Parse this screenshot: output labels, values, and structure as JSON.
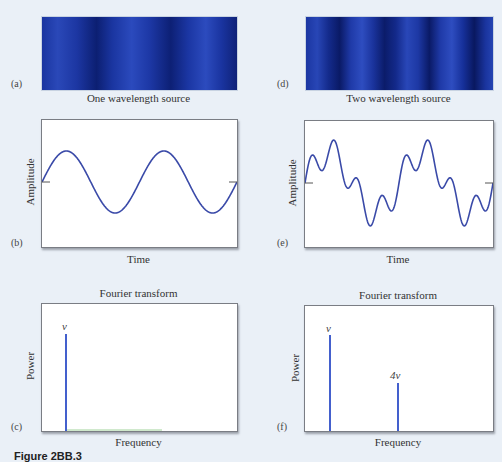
{
  "panels": {
    "a": {
      "label": "(a)",
      "caption": "One wavelength source"
    },
    "d": {
      "label": "(d)",
      "caption": "Two wavelength source"
    },
    "b": {
      "label": "(b)",
      "ylabel": "Amplitude",
      "xlabel": "Time"
    },
    "e": {
      "label": "(e)",
      "ylabel": "Amplitude",
      "xlabel": "Time"
    },
    "c": {
      "label": "(c)",
      "title": "Fourier transform",
      "ylabel": "Power",
      "xlabel": "Frequency",
      "peak_label": "ν"
    },
    "f": {
      "label": "(f)",
      "title": "Fourier transform",
      "ylabel": "Power",
      "xlabel": "Frequency",
      "peak_labels": [
        "ν",
        "4ν"
      ]
    }
  },
  "figure_caption": "Figure 2BB.3",
  "colors": {
    "wave": "#3a4aa8",
    "spectral_line": "#2f4fc8",
    "strip_blue": "#1a35a0",
    "background": "#eaf0f7"
  },
  "chart_data": [
    {
      "type": "line",
      "panel": "b",
      "title": "",
      "xlabel": "Time",
      "ylabel": "Amplitude",
      "description": "Single sinusoid, ~2 periods, starting at zero going up",
      "series": [
        {
          "name": "sin(2πνt)",
          "frequency_ratio": [
            1
          ],
          "amplitude_ratio": [
            1
          ],
          "periods_shown": 2
        }
      ]
    },
    {
      "type": "line",
      "panel": "e",
      "title": "",
      "xlabel": "Time",
      "ylabel": "Amplitude",
      "description": "Superposition of two sinusoids with frequencies ν and 4ν, ~2 periods of the fundamental",
      "series": [
        {
          "name": "sin(2πνt)+0.5·sin(2π·4νt)",
          "frequency_ratio": [
            1,
            4
          ],
          "amplitude_ratio": [
            1,
            0.5
          ],
          "periods_shown": 2
        }
      ]
    },
    {
      "type": "bar",
      "panel": "c",
      "title": "Fourier transform",
      "xlabel": "Frequency",
      "ylabel": "Power",
      "categories": [
        "ν"
      ],
      "values": [
        1.0
      ]
    },
    {
      "type": "bar",
      "panel": "f",
      "title": "Fourier transform",
      "xlabel": "Frequency",
      "ylabel": "Power",
      "categories": [
        "ν",
        "4ν"
      ],
      "values": [
        1.0,
        0.5
      ]
    }
  ]
}
